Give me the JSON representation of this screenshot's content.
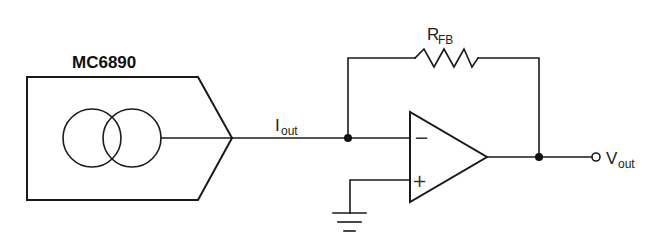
{
  "diagram": {
    "type": "circuit-schematic",
    "chip": {
      "label": "MC6890",
      "symbol": "current-source"
    },
    "signals": {
      "iout_main": "I",
      "iout_sub": "out",
      "vout_main": "V",
      "vout_sub": "out"
    },
    "feedback_resistor": {
      "main": "R",
      "sub": "FB"
    },
    "opamp": {
      "inverting_pin": "−",
      "noninverting_pin": "+"
    },
    "colors": {
      "line": "#1a1a1a",
      "background": "#ffffff"
    }
  }
}
